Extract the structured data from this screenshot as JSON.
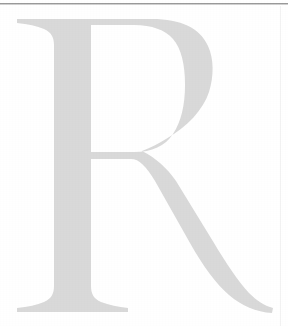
{
  "page": {
    "width": 288,
    "height": 326,
    "background_color": "#ffffff",
    "kind": "scanned-document-fragment"
  },
  "dropcap": {
    "character": "R",
    "style": "serif-capital",
    "fill_color": "#d9d9d9",
    "edge_color": "#cfcfcf",
    "label": "Drop cap letter R"
  },
  "rules": {
    "top": {
      "name": "horizontal-rule",
      "color": "#9a9a9a",
      "shadow_color": "#d0d0d0",
      "y": 3,
      "thickness": 1
    },
    "right": {
      "name": "vertical-rule",
      "color": "#f2f2f2",
      "x": 280,
      "thickness": 1
    }
  }
}
